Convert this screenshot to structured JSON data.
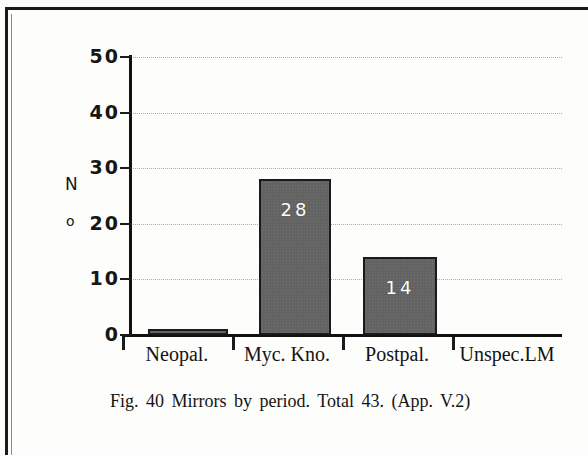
{
  "figure": {
    "caption": "Fig. 40  Mirrors  by  period.  Total 43. (App. V.2)",
    "axis_title_line1": "N",
    "axis_title_line2": "o"
  },
  "colors": {
    "bar_fill": "#636363",
    "bar_border": "#1a1a1a",
    "value_label": "#ffffff",
    "gridline": "#a9a9a9",
    "axis": "#111111",
    "text": "#141414",
    "page_background": "#fdfdfb",
    "frame": "#1a1a1a"
  },
  "chart_data": {
    "type": "bar",
    "title": "Fig. 40  Mirrors  by  period.  Total 43. (App. V.2)",
    "xlabel": "",
    "ylabel": "No",
    "categories": [
      "Neopal.",
      "Myc. Kno.",
      "Postpal.",
      "Unspec.LM"
    ],
    "values": [
      1,
      28,
      14,
      0
    ],
    "value_labels": [
      "",
      "28",
      "14",
      ""
    ],
    "ylim": [
      0,
      50
    ],
    "yticks": [
      0,
      10,
      20,
      30,
      40,
      50
    ],
    "ytick_labels": [
      "0",
      "10",
      "20",
      "30",
      "40",
      "50"
    ],
    "grid": true,
    "grid_style": "dotted-horizontal",
    "legend": false,
    "total": 43
  }
}
